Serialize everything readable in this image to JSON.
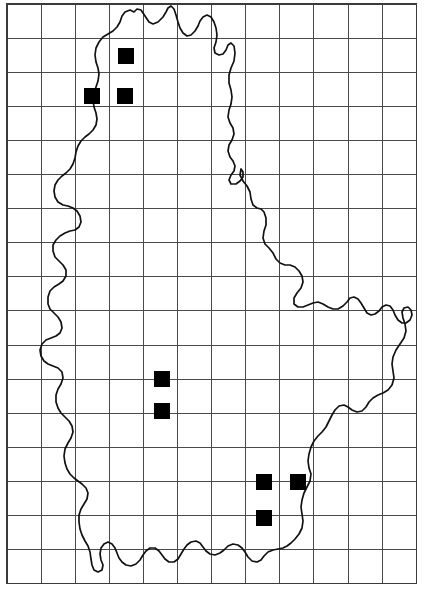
{
  "figure": {
    "name": "distribution-map",
    "region": "Luxembourg",
    "background_color": "#ffffff",
    "width": 426,
    "height": 615
  },
  "grid": {
    "line_color": "#4a4a4a",
    "frame_color": "#3a3a3a",
    "cell_size": 34.1,
    "origin_x": 7,
    "origin_y": 4,
    "columns": 12,
    "rows": 17,
    "x_lines": [
      7,
      41.1,
      75.2,
      109.3,
      143.4,
      177.5,
      211.6,
      245.7,
      279.8,
      313.9,
      348.0,
      382.1,
      416.2
    ],
    "y_lines": [
      4,
      38.1,
      72.2,
      106.3,
      140.4,
      174.5,
      208.6,
      242.7,
      276.8,
      310.9,
      345.0,
      379.1,
      413.2,
      447.3,
      481.4,
      515.5,
      549.6,
      583.7
    ]
  },
  "outline": {
    "name": "country-border",
    "color": "#111111",
    "stroke_width": 1.7,
    "path": "M 134 12 L 137 9 L 141 10 L 145 16 L 149 22 L 153 24 L 158 22 L 163 17 L 166 12 L 168 8 L 171 6 L 174 9 L 176 15 L 178 22 L 180 28 L 183 33 L 187 36 L 191 35 L 195 31 L 198 26 L 200 21 L 203 17 L 207 15 L 211 17 L 214 22 L 216 28 L 217 35 L 216 42 L 214 48 L 215 53 L 219 55 L 223 54 L 226 50 L 228 45 L 231 43 L 234 46 L 235 53 L 234 61 L 231 68 L 229 75 L 229 83 L 231 90 L 232 97 L 231 104 L 229 110 L 228 117 L 230 123 L 233 128 L 234 134 L 232 140 L 229 145 L 228 151 L 230 157 L 233 161 L 235 166 L 234 171 L 231 175 L 229 180 L 231 184 L 236 184 L 240 181 L 243 177 L 243 172 L 241 169 L 240 175 L 243 181 L 247 186 L 250 192 L 251 199 L 253 205 L 257 208 L 261 209 L 264 212 L 266 218 L 266 225 L 264 231 L 263 238 L 265 244 L 269 248 L 273 253 L 276 259 L 280 263 L 285 265 L 290 265 L 295 267 L 299 271 L 302 276 L 303 282 L 301 288 L 297 293 L 294 298 L 294 304 L 298 307 L 303 307 L 308 305 L 313 303 L 318 302 L 323 304 L 328 307 L 333 309 L 338 309 L 343 306 L 347 302 L 350 298 L 354 297 L 358 299 L 361 303 L 364 308 L 367 313 L 371 315 L 375 314 L 379 311 L 382 307 L 386 305 L 390 306 L 393 310 L 395 315 L 398 320 L 402 323 L 406 323 L 410 320 L 412 315 L 411 310 L 408 307 L 404 308 L 402 312 L 403 318 L 405 324 L 406 331 L 404 338 L 400 344 L 396 350 L 393 357 L 392 364 L 393 371 L 394 378 L 392 385 L 388 390 L 383 393 L 378 395 L 373 398 L 369 402 L 366 407 L 362 411 L 357 412 L 352 410 L 348 407 L 344 405 L 339 406 L 335 410 L 332 415 L 329 421 L 326 427 L 322 432 L 318 436 L 314 441 L 311 447 L 309 454 L 308 461 L 309 468 L 311 474 L 310 481 L 307 487 L 304 493 L 302 500 L 301 507 L 302 514 L 303 521 L 302 528 L 299 534 L 295 539 L 291 543 L 287 546 L 283 548 L 278 549 L 273 550 L 268 552 L 264 556 L 261 560 L 257 562 L 252 561 L 248 557 L 245 552 L 242 548 L 238 545 L 233 544 L 228 546 L 224 550 L 220 553 L 215 555 L 210 554 L 206 551 L 203 547 L 200 543 L 196 541 L 191 542 L 187 545 L 184 549 L 181 554 L 178 559 L 174 562 L 169 562 L 165 559 L 162 555 L 159 551 L 155 548 L 150 548 L 146 551 L 143 555 L 140 560 L 136 564 L 131 566 L 126 565 L 122 562 L 119 558 L 117 553 L 115 548 L 112 544 L 108 542 L 104 544 L 101 548 L 100 554 L 101 560 L 103 565 L 102 570 L 98 572 L 94 570 L 92 565 L 91 559 L 90 552 L 88 546 L 85 541 L 82 535 L 80 529 L 79 522 L 79 515 L 81 509 L 84 504 L 87 499 L 88 493 L 86 488 L 82 484 L 78 481 L 74 478 L 70 474 L 67 469 L 65 463 L 64 456 L 65 449 L 68 443 L 71 438 L 73 432 L 72 426 L 69 421 L 65 417 L 61 413 L 58 408 L 56 402 L 56 395 L 58 389 L 61 384 L 63 378 L 62 372 L 58 368 L 53 366 L 48 364 L 44 361 L 41 356 L 40 350 L 42 344 L 46 340 L 51 338 L 56 336 L 60 333 L 62 328 L 61 322 L 58 317 L 54 313 L 50 309 L 48 304 L 48 297 L 50 291 L 54 287 L 59 284 L 63 281 L 66 276 L 66 270 L 63 265 L 59 261 L 55 257 L 53 251 L 53 245 L 56 240 L 60 236 L 65 233 L 70 231 L 75 230 L 79 227 L 81 222 L 80 216 L 77 211 L 73 208 L 68 206 L 63 205 L 58 202 L 55 197 L 54 191 L 55 185 L 58 180 L 62 176 L 66 173 L 70 169 L 73 164 L 75 158 L 76 152 L 78 146 L 81 141 L 85 137 L 89 134 L 93 130 L 96 125 L 97 119 L 96 113 L 94 107 L 93 100 L 94 93 L 96 87 L 98 81 L 99 74 L 98 68 L 96 62 L 95 55 L 96 48 L 99 42 L 103 37 L 108 34 L 113 31 L 117 27 L 120 22 L 122 16 L 125 12 L 130 10 Z"
  },
  "records": {
    "label": "occurrence-record",
    "color": "#000000",
    "size": 16,
    "count": 8,
    "points": [
      {
        "id": "rec-1",
        "x": 118,
        "y": 48
      },
      {
        "id": "rec-2",
        "x": 84,
        "y": 88
      },
      {
        "id": "rec-3",
        "x": 117,
        "y": 88
      },
      {
        "id": "rec-4",
        "x": 154,
        "y": 371
      },
      {
        "id": "rec-5",
        "x": 154,
        "y": 403
      },
      {
        "id": "rec-6",
        "x": 256,
        "y": 474
      },
      {
        "id": "rec-7",
        "x": 290,
        "y": 474
      },
      {
        "id": "rec-8",
        "x": 256,
        "y": 510
      }
    ]
  }
}
